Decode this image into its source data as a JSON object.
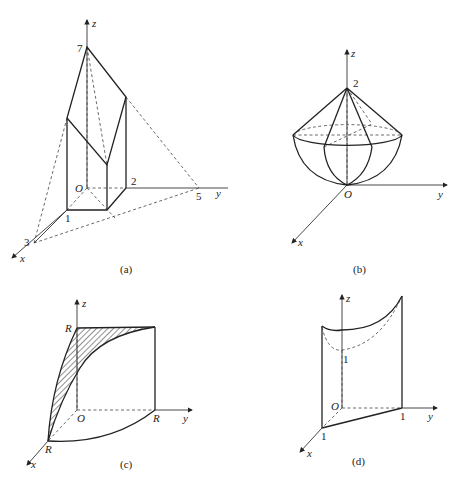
{
  "figures": [
    {
      "id": "a",
      "caption": "(a)",
      "axes": {
        "x": "x",
        "y": "y",
        "z": "z",
        "origin": "O"
      },
      "tick_labels": {
        "z_top": "7",
        "x_near": "1",
        "x_far": "3",
        "y_near": "2",
        "y_far": "5"
      },
      "description": "Prism-like solid cut by plane through (3,0,0),(0,5,0),(0,0,7) over rectangle 0<=x<=1, 0<=y<=2"
    },
    {
      "id": "b",
      "caption": "(b)",
      "axes": {
        "x": "x",
        "y": "y",
        "z": "z",
        "origin": "O"
      },
      "tick_labels": {
        "z_top": "2"
      },
      "description": "Solid bounded below by paraboloid and above by cone with apex at z=2"
    },
    {
      "id": "c",
      "caption": "(c)",
      "axes": {
        "x": "x",
        "y": "y",
        "z": "z",
        "origin": "O"
      },
      "tick_labels": {
        "z": "R",
        "x": "R",
        "y": "R"
      },
      "description": "Quarter region of intersecting cylinders of radius R with hatched surface"
    },
    {
      "id": "d",
      "caption": "(d)",
      "axes": {
        "x": "x",
        "y": "y",
        "z": "z",
        "origin": "O"
      },
      "tick_labels": {
        "z": "1",
        "x": "1",
        "y": "1"
      },
      "description": "Solid over triangle with curved top surface"
    }
  ]
}
